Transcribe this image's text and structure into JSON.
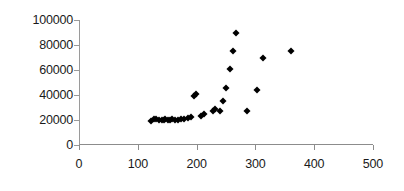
{
  "chart_data": {
    "type": "scatter",
    "title": "",
    "subtitle": "",
    "xlabel": "",
    "ylabel": "",
    "xlim": [
      0,
      500
    ],
    "ylim": [
      0,
      100000
    ],
    "grid": false,
    "legend": null,
    "legend_position": "none",
    "x_ticks": [
      0,
      100,
      200,
      300,
      400,
      500
    ],
    "y_ticks": [
      0,
      20000,
      40000,
      60000,
      80000,
      100000
    ],
    "x_tick_labels": [
      "0",
      "100",
      "200",
      "300",
      "400",
      "500"
    ],
    "y_tick_labels": [
      "0",
      "20000",
      "40000",
      "60000",
      "80000",
      "100000"
    ],
    "marker_shape": "diamond",
    "marker_color": "#000000",
    "series": [
      {
        "name": "Series 1",
        "points": [
          [
            122,
            19500
          ],
          [
            127,
            20500
          ],
          [
            131,
            21000
          ],
          [
            136,
            19800
          ],
          [
            141,
            20200
          ],
          [
            144,
            20000
          ],
          [
            147,
            20800
          ],
          [
            151,
            20300
          ],
          [
            155,
            19900
          ],
          [
            159,
            20600
          ],
          [
            163,
            20400
          ],
          [
            168,
            20100
          ],
          [
            173,
            20900
          ],
          [
            178,
            20500
          ],
          [
            186,
            21500
          ],
          [
            191,
            22300
          ],
          [
            196,
            39500
          ],
          [
            199,
            40500
          ],
          [
            208,
            23500
          ],
          [
            213,
            24500
          ],
          [
            228,
            27000
          ],
          [
            232,
            28500
          ],
          [
            240,
            27500
          ],
          [
            245,
            35000
          ],
          [
            250,
            46000
          ],
          [
            256,
            61000
          ],
          [
            262,
            75000
          ],
          [
            267,
            90000
          ],
          [
            286,
            27000
          ],
          [
            303,
            44000
          ],
          [
            313,
            70000
          ],
          [
            360,
            75000
          ]
        ]
      }
    ]
  }
}
